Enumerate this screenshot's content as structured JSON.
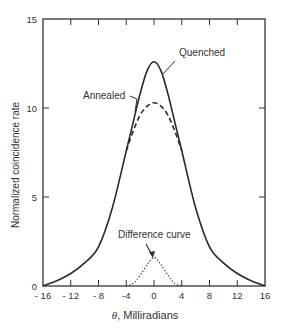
{
  "chart_data": {
    "type": "line",
    "title": "",
    "xlabel": "θ, Milliradians",
    "ylabel": "Normalized coincidence rate",
    "xlim": [
      -16,
      16
    ],
    "ylim": [
      0,
      15
    ],
    "x_ticks": [
      -16,
      -12,
      -8,
      -4,
      0,
      4,
      8,
      12,
      16
    ],
    "x_tick_labels": [
      "- 16",
      "- 12",
      "- 8",
      "-4",
      "0",
      "4",
      "8",
      "12",
      "16"
    ],
    "y_ticks": [
      0,
      5,
      10,
      15
    ],
    "y_tick_labels": [
      "0",
      "5",
      "10",
      "15"
    ],
    "grid": false,
    "legend": "none (curves labeled by annotations)",
    "series": [
      {
        "name": "Quenched",
        "style": "solid",
        "x": [
          -16,
          -14,
          -12,
          -10,
          -8,
          -6,
          -4,
          -3,
          -2,
          -1,
          0,
          1,
          2,
          3,
          4,
          6,
          8,
          10,
          12,
          14,
          16
        ],
        "y": [
          0,
          0.3,
          0.7,
          1.3,
          2.2,
          4.4,
          7.6,
          9.2,
          10.8,
          12.1,
          12.6,
          12.1,
          10.8,
          9.2,
          7.6,
          4.4,
          2.2,
          1.3,
          0.7,
          0.3,
          0
        ]
      },
      {
        "name": "Annealed",
        "style": "dashed",
        "x": [
          -4,
          -3,
          -2,
          -1,
          0,
          1,
          2,
          3,
          4
        ],
        "y": [
          7.6,
          8.7,
          9.6,
          10.1,
          10.3,
          10.1,
          9.6,
          8.7,
          7.6
        ]
      },
      {
        "name": "Difference curve",
        "style": "dotted",
        "x": [
          -4,
          -3,
          -2,
          -1,
          0,
          1,
          2,
          3,
          4
        ],
        "y": [
          0,
          0.15,
          0.6,
          1.2,
          1.6,
          1.2,
          0.6,
          0.15,
          0
        ]
      }
    ],
    "annotations": [
      {
        "text": "Quenched",
        "target_series": "Quenched"
      },
      {
        "text": "Annealed",
        "target_series": "Annealed"
      },
      {
        "text": "Difference curve",
        "target_series": "Difference curve"
      }
    ]
  }
}
